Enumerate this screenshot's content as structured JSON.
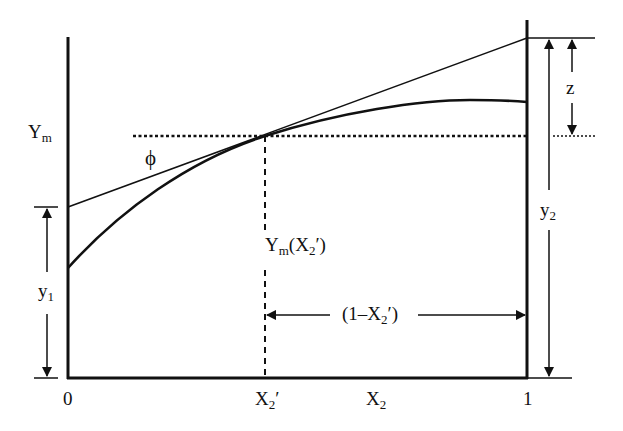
{
  "diagram": {
    "type": "tangent-intercept construction (partial molar quantity)",
    "labels": {
      "y_axis_value": "Y",
      "y_axis_value_sub": "m",
      "angle": "ϕ",
      "tangent_point": "Y",
      "tangent_point_sub": "m",
      "tangent_point_arg": "(X",
      "tangent_point_arg_sub": "2",
      "tangent_point_arg_end": "′)",
      "left_intercept": "y",
      "left_intercept_sub": "1",
      "right_intercept": "y",
      "right_intercept_sub": "2",
      "gap": "z",
      "span_open": "(1–X",
      "span_sub": "2",
      "span_close": "′)",
      "x_origin": "0",
      "x_point": "X",
      "x_point_sub": "2",
      "x_point_prime": "′",
      "x_axis": "X",
      "x_axis_sub": "2",
      "x_end": "1"
    },
    "colors": {
      "ink": "#111111",
      "background": "#ffffff"
    }
  }
}
